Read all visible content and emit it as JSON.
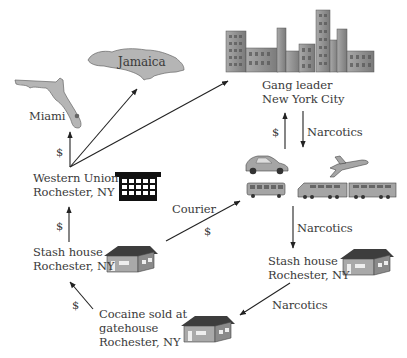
{
  "nodes": {
    "jamaica": {
      "label": "Jamaica"
    },
    "miami": {
      "label": "Miami"
    },
    "new_york": {
      "line1": "Gang leader",
      "line2": "New York City"
    },
    "western_union": {
      "line1": "Western Union",
      "line2": "Rochester, NY"
    },
    "stash_house_left": {
      "line1": "Stash house",
      "line2": "Rochester, NY"
    },
    "stash_house_right": {
      "line1": "Stash house",
      "line2": "Rochester, NY"
    },
    "gatehouse": {
      "line1": "Cocaine sold at",
      "line2": "gatehouse",
      "line3": "Rochester, NY"
    },
    "transport": {
      "items": [
        "car",
        "plane",
        "bus",
        "train"
      ]
    }
  },
  "edges": {
    "wu_to_miami": {
      "label": "$"
    },
    "nyc_up_money": {
      "label": "$"
    },
    "nyc_down_narcotics": {
      "label": "Narcotics"
    },
    "stash_to_wu": {
      "label": "$"
    },
    "courier": {
      "label": "Courier",
      "sublabel": "$"
    },
    "transport_to_stash": {
      "label": "Narcotics"
    },
    "stash_to_gatehouse": {
      "label": "Narcotics"
    },
    "gatehouse_to_stash": {
      "label": "$"
    }
  },
  "colors": {
    "map_fill": "#b5b5b5",
    "building_fill": "#8f8f8f",
    "roof": "#3d3d3d",
    "arrow": "#222222",
    "text": "#3a3a3a"
  }
}
